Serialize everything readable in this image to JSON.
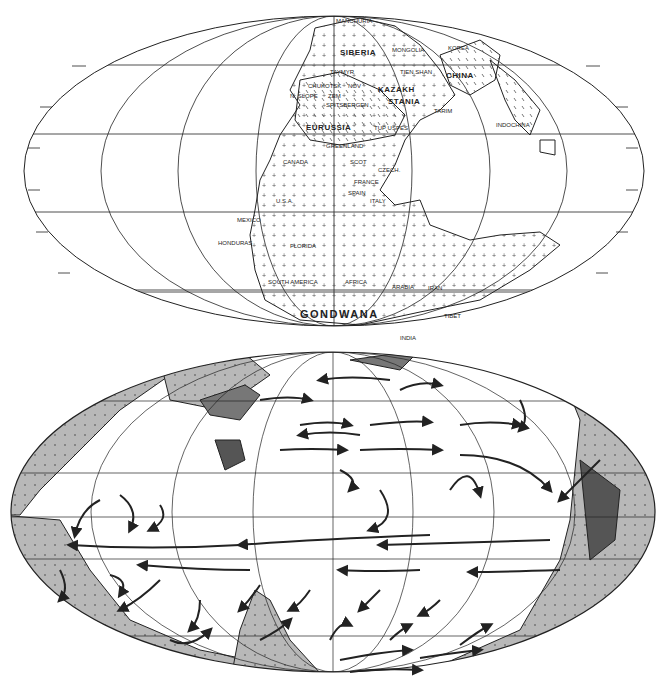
{
  "figure": {
    "top_map": {
      "projection": "Mollweide",
      "description": "Pangaea paleogeographic reconstruction",
      "labels": {
        "supercontinent": "GONDWANA",
        "siberia": "SIBERIA",
        "kazakhstania_1": "KAZAKH",
        "kazakhstania_2": "STANIA",
        "china": "CHINA",
        "euramerica": "EURUSSIA",
        "mongolia": "MONGOLIA",
        "korea": "KOREA",
        "manchuria": "MANCHURIA",
        "taymyr": "TAYMYR",
        "tien_shan": "TIEN SHAN",
        "tarim": "TARIM",
        "indochina": "INDOCHINA",
        "chukotsk": "CHUKOTSK",
        "nov": "NOV",
        "n_slope": "N. SLOPE",
        "zem": "ZEM",
        "spitsbergen": "SPITSBERGEN",
        "tup_uspes": "TUP USPES",
        "canada": "CANADA",
        "usa": "U.S.A.",
        "scot": "SCOT",
        "greenland": "GREENLAND",
        "czech": "CZECH.",
        "france": "FRANCE",
        "spain": "SPAIN",
        "italy": "ITALY",
        "mexico": "MEXICO",
        "honduras": "HONDURAS",
        "florida": "FLORIDA",
        "south_america": "SOUTH AMERICA",
        "africa": "AFRICA",
        "arabia": "ARABIA",
        "iran": "IRAN",
        "tibet": "TIBET",
        "india": "INDIA",
        "madagascar": "MADAGASCAR",
        "australia": "AUSTRALIA",
        "e_antarctica": "E. ANTARCTICA",
        "byrd": "BYRD",
        "palmer_pen": "PALMER PEN.",
        "ellsworth_mts": "ELLSWORTH MTS.",
        "new_zealand": "NEW Z."
      }
    },
    "bottom_map": {
      "projection": "Mollweide",
      "description": "Ocean surface current circulation around Pangaea",
      "colors": {
        "land": "#b8b8b8",
        "land_dark": "#555555",
        "ocean": "#ffffff",
        "arrows": "#222222"
      }
    }
  }
}
